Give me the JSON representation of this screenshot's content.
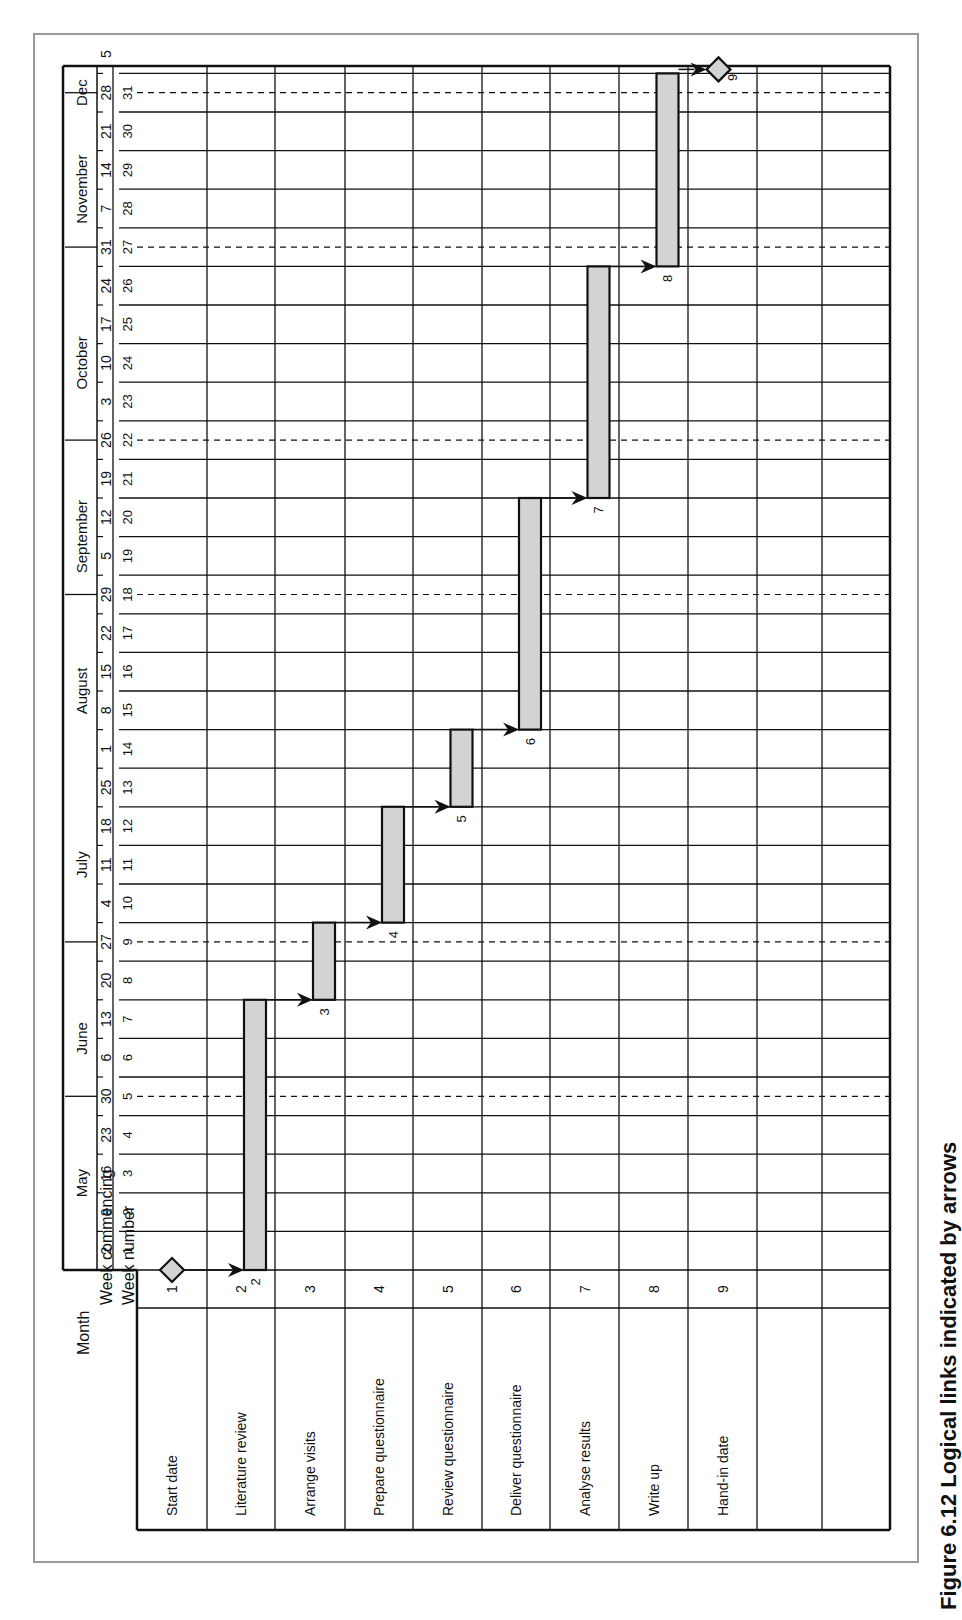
{
  "caption": "Figure 6.12 Logical links indicated by arrows",
  "colors": {
    "bar_fill": "#d3d3d3",
    "line": "#111111",
    "frame": "#9a9a9a"
  },
  "header_labels": {
    "month": "Month",
    "week_commencing": "Week commencing",
    "week_number": "Week number"
  },
  "chart_data": {
    "type": "gantt",
    "title": "Figure 6.12 Logical links indicated by arrows",
    "orientation": "rotated 90° counter-clockwise (time runs bottom→top)",
    "months": [
      {
        "label": "May",
        "start_week": 1,
        "end_week": 4.5
      },
      {
        "label": "June",
        "start_week": 4.5,
        "end_week": 8.5
      },
      {
        "label": "July",
        "start_week": 8.5,
        "end_week": 13.5
      },
      {
        "label": "August",
        "start_week": 13.5,
        "end_week": 17.5
      },
      {
        "label": "September",
        "start_week": 17.5,
        "end_week": 21.5
      },
      {
        "label": "October",
        "start_week": 21.5,
        "end_week": 26.5
      },
      {
        "label": "November",
        "start_week": 26.5,
        "end_week": 30.5
      },
      {
        "label": "Dec",
        "start_week": 30.5,
        "end_week": 31.5
      }
    ],
    "week_commencing": [
      "2",
      "9",
      "16",
      "23",
      "30",
      "6",
      "13",
      "20",
      "27",
      "4",
      "11",
      "18",
      "25",
      "1",
      "8",
      "15",
      "22",
      "29",
      "5",
      "12",
      "19",
      "26",
      "3",
      "10",
      "17",
      "24",
      "31",
      "7",
      "14",
      "21",
      "28",
      "5"
    ],
    "week_numbers": [
      1,
      2,
      3,
      4,
      5,
      6,
      7,
      8,
      9,
      10,
      11,
      12,
      13,
      14,
      15,
      16,
      17,
      18,
      19,
      20,
      21,
      22,
      23,
      24,
      25,
      26,
      27,
      28,
      29,
      30,
      31
    ],
    "month_dividers_dashed_at_weeks": [
      4.5,
      8.5,
      17.5,
      21.5,
      26.5,
      30.5
    ],
    "tasks": [
      {
        "id": 1,
        "label": "Start date",
        "type": "milestone",
        "week": 0
      },
      {
        "id": 2,
        "label": "Literature review",
        "type": "task",
        "start_week": 1,
        "end_week": 7
      },
      {
        "id": 3,
        "label": "Arrange visits",
        "type": "task",
        "start_week": 8,
        "end_week": 9
      },
      {
        "id": 4,
        "label": "Prepare questionnaire",
        "type": "task",
        "start_week": 10,
        "end_week": 12
      },
      {
        "id": 5,
        "label": "Review questionnaire",
        "type": "task",
        "start_week": 13,
        "end_week": 14
      },
      {
        "id": 6,
        "label": "Deliver questionnaire",
        "type": "task",
        "start_week": 15,
        "end_week": 20
      },
      {
        "id": 7,
        "label": "Analyse results",
        "type": "task",
        "start_week": 21,
        "end_week": 26
      },
      {
        "id": 8,
        "label": "Write up",
        "type": "task",
        "start_week": 27,
        "end_week": 31
      },
      {
        "id": 9,
        "label": "Hand-in date",
        "type": "milestone",
        "week": 31
      },
      {
        "id": "",
        "label": "",
        "type": "empty"
      },
      {
        "id": "",
        "label": "",
        "type": "empty"
      }
    ],
    "links": [
      [
        1,
        2
      ],
      [
        2,
        3
      ],
      [
        3,
        4
      ],
      [
        4,
        5
      ],
      [
        5,
        6
      ],
      [
        6,
        7
      ],
      [
        7,
        8
      ],
      [
        8,
        9
      ]
    ]
  }
}
